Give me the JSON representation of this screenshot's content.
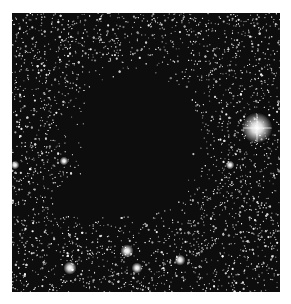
{
  "image": {
    "subject": "dark nebula / globule silhouetted against a dense star field",
    "background_color": "#ffffff",
    "field_color": "#0d0d0d",
    "nebula_color": "#000000",
    "bright_stars": [
      {
        "x": 245,
        "y": 115,
        "r": 7
      },
      {
        "x": 115,
        "y": 238,
        "r": 3
      },
      {
        "x": 58,
        "y": 255,
        "r": 3
      },
      {
        "x": 125,
        "y": 255,
        "r": 2.5
      },
      {
        "x": 168,
        "y": 247,
        "r": 2.5
      },
      {
        "x": 52,
        "y": 148,
        "r": 2
      },
      {
        "x": 3,
        "y": 152,
        "r": 2
      },
      {
        "x": 218,
        "y": 152,
        "r": 2
      }
    ],
    "nebula": {
      "cx": 125,
      "cy": 130,
      "rx": 65,
      "ry": 78
    }
  }
}
